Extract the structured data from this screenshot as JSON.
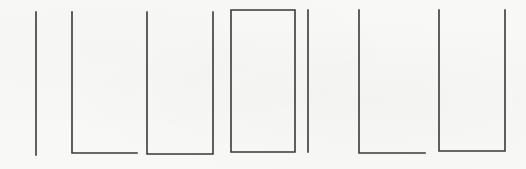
{
  "figure": {
    "stroke_color": "#3a3a3a",
    "background_color": "#f8f8f7",
    "shapes": [
      {
        "id": 1,
        "type": "bar",
        "label": "vertical-bar-1",
        "points": [
          [
            36,
            12
          ],
          [
            36,
            155
          ]
        ]
      },
      {
        "id": 2,
        "type": "L",
        "label": "l-shape-1",
        "points": [
          [
            72,
            12
          ],
          [
            72,
            153
          ],
          [
            137,
            153
          ]
        ]
      },
      {
        "id": 3,
        "type": "U",
        "label": "u-shape-1",
        "points": [
          [
            147,
            12
          ],
          [
            147,
            154
          ],
          [
            213,
            154
          ],
          [
            213,
            12
          ]
        ]
      },
      {
        "id": 4,
        "type": "box",
        "label": "closed-box",
        "points": [
          [
            231,
            10
          ],
          [
            295,
            10
          ],
          [
            295,
            152
          ],
          [
            231,
            152
          ],
          [
            231,
            10
          ]
        ]
      },
      {
        "id": 5,
        "type": "bar",
        "label": "vertical-bar-2",
        "points": [
          [
            308,
            10
          ],
          [
            308,
            152
          ]
        ]
      },
      {
        "id": 6,
        "type": "L",
        "label": "l-shape-2",
        "points": [
          [
            359,
            10
          ],
          [
            359,
            153
          ],
          [
            425,
            153
          ]
        ]
      },
      {
        "id": 7,
        "type": "U",
        "label": "u-shape-2",
        "points": [
          [
            439,
            10
          ],
          [
            439,
            151
          ],
          [
            505,
            151
          ],
          [
            505,
            10
          ]
        ]
      }
    ]
  }
}
